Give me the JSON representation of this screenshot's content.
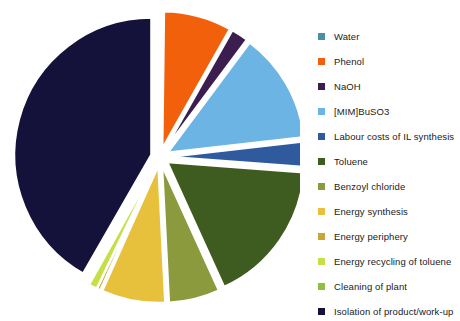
{
  "chart_data": {
    "type": "pie",
    "title": "",
    "xlabel": "",
    "ylabel": "",
    "legend_position": "right",
    "exploded": true,
    "start_angle_deg": 0,
    "direction": "clockwise",
    "units": "percent of total cost",
    "categories": [
      "Water",
      "Phenol",
      "NaOH",
      "[MIM]BuSO3",
      "Labour costs of IL synthesis",
      "Toluene",
      "Benzoyl chloride",
      "Energy synthesis",
      "Energy periphery",
      "Energy recycling of toluene",
      "Cleaning of plant",
      "Isolation of product/work-up"
    ],
    "values": [
      0.2,
      8.0,
      2.0,
      13.0,
      3.0,
      17.0,
      6.0,
      7.5,
      0.4,
      1.0,
      0.2,
      41.7
    ],
    "colors": [
      "#4a90a4",
      "#f2600c",
      "#3b1d4e",
      "#6cb4e4",
      "#2f5b9e",
      "#3e5c20",
      "#8a9a3c",
      "#e8c13c",
      "#c8a63a",
      "#c4e045",
      "#8fbf3f",
      "#14123a"
    ],
    "series": [
      {
        "name": "Cost distribution",
        "values": [
          0.2,
          8.0,
          2.0,
          13.0,
          3.0,
          17.0,
          6.0,
          7.5,
          0.4,
          1.0,
          0.2,
          41.7
        ]
      }
    ]
  },
  "legend": {
    "items": [
      {
        "label": "Water",
        "color": "#4a90a4"
      },
      {
        "label": "Phenol",
        "color": "#f2600c"
      },
      {
        "label": "NaOH",
        "color": "#3b1d4e"
      },
      {
        "label": "[MIM]BuSO3",
        "color": "#6cb4e4"
      },
      {
        "label": "Labour costs of IL synthesis",
        "color": "#2f5b9e"
      },
      {
        "label": "Toluene",
        "color": "#3e5c20"
      },
      {
        "label": "Benzoyl chloride",
        "color": "#8a9a3c"
      },
      {
        "label": "Energy synthesis",
        "color": "#e8c13c"
      },
      {
        "label": "Energy periphery",
        "color": "#c8a63a"
      },
      {
        "label": "Energy recycling of toluene",
        "color": "#c4e045"
      },
      {
        "label": "Cleaning of plant",
        "color": "#8fbf3f"
      },
      {
        "label": "Isolation of product/work-up",
        "color": "#14123a"
      }
    ]
  }
}
